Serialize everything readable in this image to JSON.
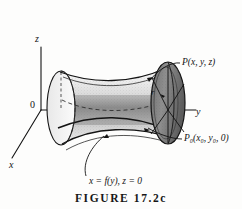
{
  "figure": {
    "caption": "FIGURE 17.2c",
    "axes": {
      "z_label": "z",
      "y_label": "y",
      "x_label": "x",
      "origin_label": "0"
    },
    "annotations": {
      "point_p": "P(x, y, z)",
      "point_p0_name": "P",
      "point_p0_sub": "0",
      "point_p0_args": "(x₀, y₀, 0)",
      "point_p0_full": "P₀(x₀, y₀, 0)",
      "radius_label": "r",
      "generating_curve": "x = f(y), z = 0"
    },
    "colors": {
      "ink": "#141414",
      "background": "#fdfdfc",
      "shading": "#8a8a8a",
      "hidden_line": "#3a3a3a"
    }
  }
}
